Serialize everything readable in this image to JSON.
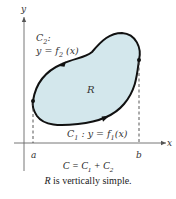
{
  "figure": {
    "axes": {
      "x_label": "x",
      "y_label": "y"
    },
    "points": {
      "a_label": "a",
      "b_label": "b"
    },
    "region": {
      "label": "R",
      "fill_color": "#d3e7ec",
      "boundary_color": "#111111"
    },
    "curves": {
      "upper": {
        "name": "C",
        "subscript": "2",
        "suffix": ":",
        "equation_prefix": "y = f",
        "equation_subscript": "2",
        "equation_suffix": " (x)"
      },
      "lower": {
        "name": "C",
        "subscript": "1",
        "equation_prefix": " : y = f",
        "equation_subscript": "1",
        "equation_suffix": "(x)"
      }
    },
    "caption": {
      "line1_lhs": "C = C",
      "line1_sub1": "1",
      "line1_mid": " + C",
      "line1_sub2": "2",
      "line2_var": "R",
      "line2_text": " is vertically simple."
    }
  }
}
